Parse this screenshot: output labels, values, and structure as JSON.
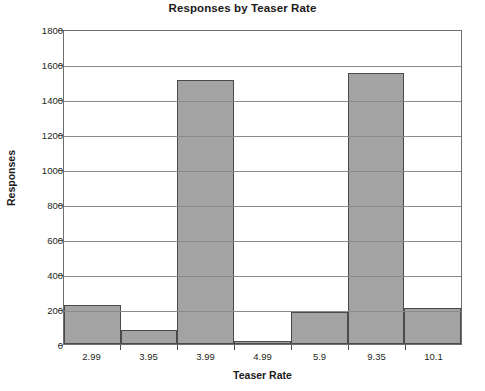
{
  "chart_data": {
    "type": "bar",
    "title": "Responses by Teaser Rate",
    "xlabel": "Teaser Rate",
    "ylabel": "Responses",
    "categories": [
      "2.99",
      "3.95",
      "3.99",
      "4.99",
      "5.9",
      "9.35",
      "10.1"
    ],
    "values": [
      225,
      80,
      1510,
      20,
      183,
      1550,
      205
    ],
    "ylim": [
      0,
      1800
    ],
    "yticks": [
      0,
      200,
      400,
      600,
      800,
      1000,
      1200,
      1400,
      1600,
      1800
    ],
    "ytick_labels": [
      "0",
      "200",
      "400",
      "600",
      "800",
      "1000",
      "1200",
      "1400",
      "1600",
      "1800"
    ],
    "grid": true,
    "legend": false,
    "bar_color": "#a3a3a3",
    "bar_border_color": "#4a4a4a",
    "axis_color": "#6e6e6e",
    "text_color": "#231f20"
  }
}
